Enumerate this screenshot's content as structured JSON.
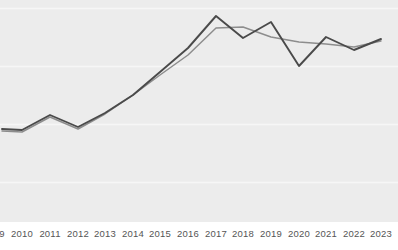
{
  "chart_data": {
    "type": "line",
    "title": "",
    "subtitle": "",
    "xlabel": "",
    "ylabel": "",
    "grid": true,
    "grid_orientation": "horizontal",
    "gridline_values": [
      8,
      66,
      124,
      182
    ],
    "legend": "none",
    "legend_position": "none",
    "annotations": [],
    "note": "Plot is cropped on the left: the 2009 tick label is clipped at the image edge and both series continue beyond the left border.",
    "x": [
      2009,
      2010,
      2011,
      2012,
      2013,
      2014,
      2015,
      2016,
      2017,
      2018,
      2019,
      2020,
      2021,
      2022,
      2023
    ],
    "xlim": [
      2009,
      2023
    ],
    "ylim": [
      0,
      100
    ],
    "categories": [
      "2009",
      "2010",
      "2011",
      "2012",
      "2013",
      "2014",
      "2015",
      "2016",
      "2017",
      "2018",
      "2019",
      "2020",
      "2021",
      "2022",
      "2023"
    ],
    "tick_labels": [
      "9",
      "2010",
      "2011",
      "2012",
      "2013",
      "2014",
      "2015",
      "2016",
      "2017",
      "2018",
      "2019",
      "2020",
      "2021",
      "2022",
      "2023"
    ],
    "series": [
      {
        "name": "series-dark",
        "color": "#4a4a4a",
        "width": 1.9,
        "values": [
          48,
          47,
          54,
          49,
          56,
          64,
          74,
          85,
          98,
          88,
          95,
          74,
          84,
          78,
          84
        ]
      },
      {
        "name": "series-light",
        "color": "#8d8d8d",
        "width": 1.5,
        "values": [
          47,
          46,
          53,
          48,
          55,
          64,
          72,
          81,
          90,
          91,
          87,
          85,
          82,
          81,
          83
        ]
      }
    ],
    "pixel_geometry": {
      "plot_width": 398,
      "plot_height": 222,
      "x_positions": [
        2,
        22,
        50,
        78,
        105,
        133,
        160,
        188,
        216,
        243,
        271,
        299,
        326,
        354,
        381
      ],
      "y_dark": [
        129,
        130,
        115,
        127,
        113,
        95,
        72,
        48,
        16,
        38,
        22,
        66,
        37,
        50,
        39
      ],
      "y_light": [
        131,
        132,
        117,
        129,
        114,
        95,
        75,
        55,
        28,
        27,
        37,
        42,
        44,
        47,
        41
      ]
    },
    "colors": {
      "background": "#ececec",
      "page": "#ffffff",
      "gridline": "#f6f6f6",
      "tick_text": "#555555"
    }
  }
}
